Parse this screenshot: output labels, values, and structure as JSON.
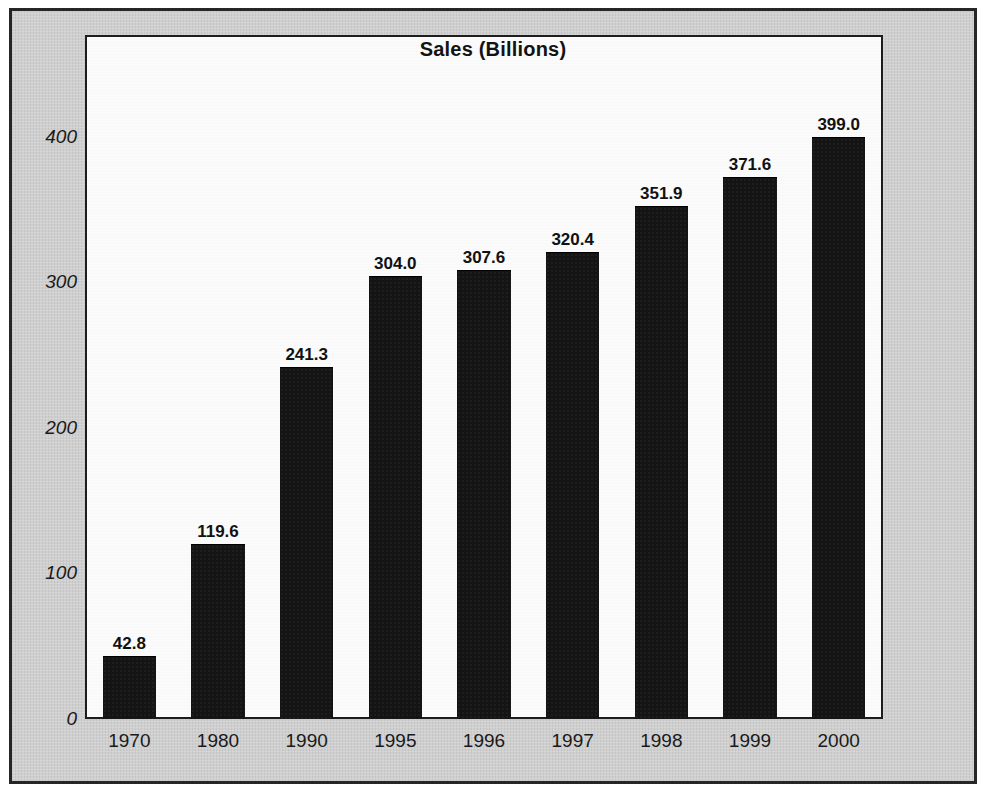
{
  "chart_data": {
    "type": "bar",
    "title": "Sales (Billions)",
    "xlabel": "",
    "ylabel": "",
    "categories": [
      "1970",
      "1980",
      "1990",
      "1995",
      "1996",
      "1997",
      "1998",
      "1999",
      "2000"
    ],
    "values": [
      42.8,
      119.6,
      241.3,
      304.0,
      307.6,
      320.4,
      351.9,
      371.6,
      399.0
    ],
    "value_labels": [
      "42.8",
      "119.6",
      "241.3",
      "304.0",
      "307.6",
      "320.4",
      "351.9",
      "371.6",
      "399.0"
    ],
    "ylim": [
      0,
      470
    ],
    "yticks": [
      0,
      100,
      200,
      300,
      400
    ],
    "ytick_labels": [
      "0",
      "100",
      "200",
      "300",
      "400"
    ],
    "grid": false,
    "legend": false,
    "bar_color": "#141414",
    "plot_background": "#fbfbfb",
    "page_background": "#cfcfcf",
    "text_color": "#1a1a1a"
  },
  "axis": {
    "y": {
      "ticks": [
        {
          "label": "400",
          "value": 400
        },
        {
          "label": "300",
          "value": 300
        },
        {
          "label": "200",
          "value": 200
        },
        {
          "label": "100",
          "value": 100
        },
        {
          "label": "0",
          "value": 0
        }
      ]
    },
    "x": {
      "ticks": [
        {
          "label": "1970"
        },
        {
          "label": "1980"
        },
        {
          "label": "1990"
        },
        {
          "label": "1995"
        },
        {
          "label": "1996"
        },
        {
          "label": "1997"
        },
        {
          "label": "1998"
        },
        {
          "label": "1999"
        },
        {
          "label": "2000"
        }
      ]
    }
  }
}
